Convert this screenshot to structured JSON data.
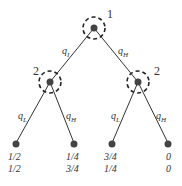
{
  "tree": {
    "root": {
      "player": "1"
    },
    "left_node": {
      "player": "2"
    },
    "right_node": {
      "player": "2"
    },
    "edges": {
      "root_left": {
        "q": "q",
        "sub": "I"
      },
      "root_right": {
        "q": "q",
        "sub": "H"
      },
      "left_left": {
        "q": "q",
        "sub": "L"
      },
      "left_right": {
        "q": "q",
        "sub": "H"
      },
      "right_left": {
        "q": "q",
        "sub": "L"
      },
      "right_right": {
        "q": "q",
        "sub": "H"
      }
    },
    "payoffs": [
      {
        "p1": "1/2",
        "p2": "1/2"
      },
      {
        "p1": "1/4",
        "p2": "3/4"
      },
      {
        "p1": "3/4",
        "p2": "1/4"
      },
      {
        "p1": "0",
        "p2": "0"
      }
    ]
  }
}
